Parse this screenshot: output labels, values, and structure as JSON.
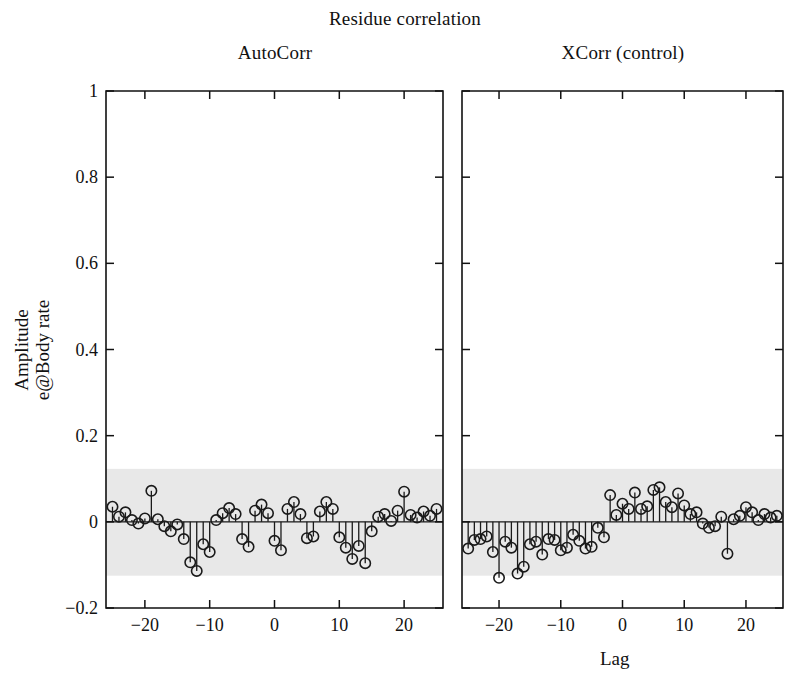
{
  "chart_data": {
    "type": "line",
    "title": "Residue correlation",
    "xlabel": "Lag",
    "ylabel_line1": "Amplitude",
    "ylabel_line2": "e@Body rate",
    "xlim": [
      -26,
      26
    ],
    "ylim": [
      -0.2,
      1.0
    ],
    "yticks": [
      1,
      0.8,
      0.6,
      0.4,
      0.2,
      0,
      -0.2
    ],
    "ytick_labels": [
      "1",
      "0.8",
      "0.6",
      "0.4",
      "0.2",
      "0",
      "−0.2"
    ],
    "xticks": [
      -20,
      -10,
      0,
      10,
      20
    ],
    "xtick_labels": [
      "−20",
      "−10",
      "0",
      "10",
      "20"
    ],
    "grid": false,
    "legend": "none",
    "marker": "open-circle",
    "confidence_band": {
      "upper": 0.123,
      "lower": -0.125,
      "color": "#e8e8e8",
      "label": "95% confidence band"
    },
    "panels": [
      {
        "name": "autocorr",
        "title": "AutoCorr",
        "x": [
          -25,
          -24,
          -23,
          -22,
          -21,
          -20,
          -19,
          -18,
          -17,
          -16,
          -15,
          -14,
          -13,
          -12,
          -11,
          -10,
          -9,
          -8,
          -7,
          -6,
          -5,
          -4,
          -3,
          -2,
          -1,
          0,
          1,
          2,
          3,
          4,
          5,
          6,
          7,
          8,
          9,
          10,
          11,
          12,
          13,
          14,
          15,
          16,
          17,
          18,
          19,
          20,
          21,
          22,
          23,
          24,
          25
        ],
        "values": [
          0.035,
          0.012,
          0.022,
          0.004,
          -0.004,
          0.008,
          0.072,
          0.006,
          -0.01,
          -0.022,
          -0.006,
          -0.04,
          -0.094,
          -0.114,
          -0.052,
          -0.07,
          0.004,
          0.02,
          0.032,
          0.018,
          -0.04,
          -0.058,
          0.026,
          0.04,
          0.02,
          -0.044,
          -0.066,
          0.03,
          0.046,
          0.018,
          -0.038,
          -0.034,
          0.024,
          0.046,
          0.03,
          -0.036,
          -0.06,
          -0.086,
          -0.056,
          -0.096,
          -0.022,
          0.012,
          0.018,
          0.002,
          0.026,
          0.07,
          0.016,
          0.01,
          0.024,
          0.014,
          0.03
        ]
      },
      {
        "name": "xcorr_control",
        "title": "XCorr (control)",
        "x": [
          -25,
          -24,
          -23,
          -22,
          -21,
          -20,
          -19,
          -18,
          -17,
          -16,
          -15,
          -14,
          -13,
          -12,
          -11,
          -10,
          -9,
          -8,
          -7,
          -6,
          -5,
          -4,
          -3,
          -2,
          -1,
          0,
          1,
          2,
          3,
          4,
          5,
          6,
          7,
          8,
          9,
          10,
          11,
          12,
          13,
          14,
          15,
          16,
          17,
          18,
          19,
          20,
          21,
          22,
          23,
          24,
          25
        ],
        "values": [
          -0.062,
          -0.042,
          -0.04,
          -0.034,
          -0.07,
          -0.13,
          -0.046,
          -0.06,
          -0.12,
          -0.104,
          -0.052,
          -0.046,
          -0.076,
          -0.04,
          -0.042,
          -0.066,
          -0.06,
          -0.03,
          -0.044,
          -0.062,
          -0.058,
          -0.014,
          -0.036,
          0.062,
          0.016,
          0.042,
          0.03,
          0.068,
          0.03,
          0.036,
          0.074,
          0.08,
          0.046,
          0.034,
          0.066,
          0.038,
          0.018,
          0.022,
          -0.004,
          -0.014,
          -0.01,
          0.012,
          -0.074,
          0.006,
          0.014,
          0.034,
          0.022,
          0.004,
          0.018,
          0.01,
          0.014
        ]
      }
    ]
  }
}
